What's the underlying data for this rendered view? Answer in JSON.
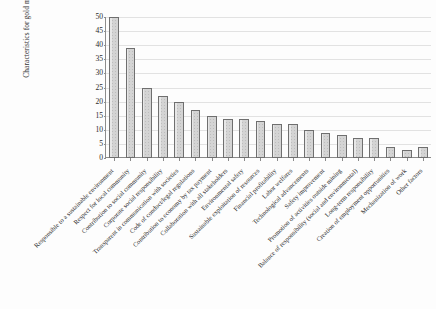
{
  "chart_data": {
    "type": "bar",
    "title": "",
    "xlabel": "",
    "ylabel": "Characteristics for gold mining, %",
    "ylim": [
      0,
      50
    ],
    "yticks": [
      0,
      5,
      10,
      15,
      20,
      25,
      30,
      35,
      40,
      45,
      50
    ],
    "grid": true,
    "legend": false,
    "bar_color": "#d4d4d4",
    "bar_edge_color": "#6f6f6f",
    "categories": [
      "Responsible to a sustainable environment",
      "Respect for local community",
      "Contribution to social community",
      "Corporate social responsibility",
      "Transparent in communication with societies",
      "Code of conduct/legal regulations",
      "Contribution to economy by tax payment",
      "Collaboration with all stakeholders",
      "Environmental safety",
      "Sustainable exploitation of resources",
      "Financial profitability",
      "Labor welfares",
      "Technological advancements",
      "Safety improvement",
      "Promotion of activities outside mining",
      "Balance of responsibility (social and environmental)",
      "Long-term responsibility",
      "Creation of employment opportunities",
      "Mechanization of work",
      "Other factors"
    ],
    "values": [
      50,
      39,
      25,
      22,
      20,
      17,
      15,
      14,
      14,
      13,
      12,
      12,
      10,
      9,
      8,
      7,
      7,
      4,
      3,
      4
    ]
  }
}
